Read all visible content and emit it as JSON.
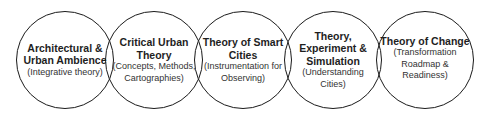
{
  "diagram": {
    "circles": [
      {
        "title": "Architectural & Urban Ambience",
        "title_lines": [
          "Architectural &",
          "Urban Ambience"
        ],
        "subtitle_lines": [
          "(Integrative theory)"
        ],
        "cx": 65,
        "cy": 60
      },
      {
        "title": "Critical Urban Theory",
        "title_lines": [
          "Critical Urban",
          "Theory"
        ],
        "subtitle_lines": [
          "(Concepts, Methods,",
          "Cartographies)"
        ],
        "cx": 154,
        "cy": 60
      },
      {
        "title": "Theory of Smart Cities",
        "title_lines": [
          "Theory of Smart",
          "Cities"
        ],
        "subtitle_lines": [
          "(Instrumentation for",
          "Observing)"
        ],
        "cx": 243,
        "cy": 60
      },
      {
        "title": "Theory, Experiment & Simulation",
        "title_lines": [
          "Theory,",
          "Experiment &",
          "Simulation"
        ],
        "subtitle_lines": [
          "(Understanding",
          "Cities)"
        ],
        "cx": 333,
        "cy": 60
      },
      {
        "title": "Theory of Change",
        "title_lines": [
          "Theory of Change"
        ],
        "subtitle_lines": [
          "(Transformation",
          "Roadmap &",
          "Readiness)"
        ],
        "cx": 425,
        "cy": 60
      }
    ],
    "stroke_color": "#1a1a1a",
    "background": "#ffffff"
  }
}
